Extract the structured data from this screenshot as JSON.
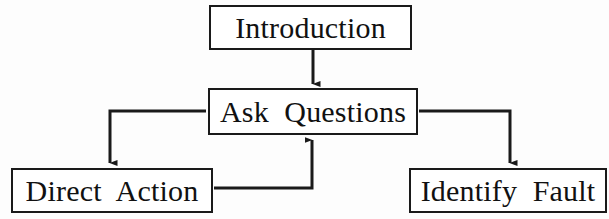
{
  "diagram": {
    "type": "flowchart",
    "background_color": "#fdfdfd",
    "line_color": "#1a1a1a",
    "text_color": "#111111",
    "nodes": [
      {
        "id": "introduction",
        "label": "Introduction"
      },
      {
        "id": "ask_questions",
        "label": "Ask  Questions"
      },
      {
        "id": "direct_action",
        "label": "Direct  Action"
      },
      {
        "id": "identify_fault",
        "label": "Identify  Fault"
      }
    ],
    "edges": [
      {
        "id": "intro-to-ask",
        "from": "Introduction",
        "to": "Ask Questions",
        "arrow": "down"
      },
      {
        "id": "ask-to-direct",
        "from": "Ask Questions",
        "to": "Direct Action",
        "arrow": "down"
      },
      {
        "id": "ask-to-identify",
        "from": "Ask Questions",
        "to": "Identify Fault",
        "arrow": "down"
      },
      {
        "id": "direct-back-to-ask",
        "from": "Direct Action",
        "to": "Ask Questions",
        "arrow": "up"
      }
    ]
  }
}
